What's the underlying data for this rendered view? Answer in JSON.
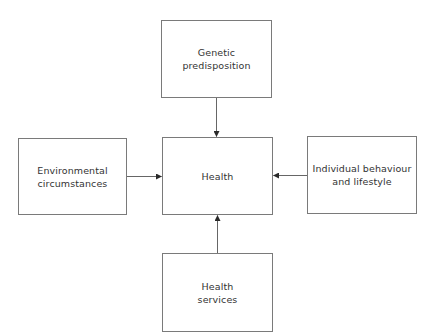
{
  "diagram": {
    "type": "influence-diagram",
    "center": {
      "id": "health",
      "label": "Health"
    },
    "nodes": [
      {
        "id": "genetic",
        "label": "Genetic\npredisposition",
        "position": "top"
      },
      {
        "id": "environment",
        "label": "Environmental\ncircumstances",
        "position": "left"
      },
      {
        "id": "behaviour",
        "label": "Individual behaviour\nand lifestyle",
        "position": "right"
      },
      {
        "id": "services",
        "label": "Health\nservices",
        "position": "bottom"
      }
    ],
    "edges": [
      {
        "from": "genetic",
        "to": "health"
      },
      {
        "from": "environment",
        "to": "health"
      },
      {
        "from": "behaviour",
        "to": "health"
      },
      {
        "from": "services",
        "to": "health"
      }
    ],
    "colors": {
      "border": "#7a7a7a",
      "arrow": "#555555",
      "text": "#333333",
      "background": "#ffffff"
    }
  }
}
